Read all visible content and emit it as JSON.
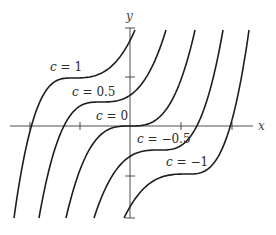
{
  "chart_data": {
    "type": "line",
    "title": "",
    "xlabel": "x",
    "ylabel": "y",
    "xlim": [
      -2.3,
      2.9
    ],
    "ylim": [
      -1.85,
      1.95
    ],
    "grid": false,
    "legend": "inline labels",
    "x_ticks": [
      -2,
      -1,
      1,
      2
    ],
    "y_ticks": [
      -2,
      -1,
      1,
      2
    ],
    "tick_labels_shown": false,
    "series": [
      {
        "name": "c = 1",
        "c": 1,
        "inflection": [
          -1.16,
          0.96
        ],
        "label_pos": [
          36,
          66
        ]
      },
      {
        "name": "c = 0.5",
        "c": 0.5,
        "inflection": [
          -0.6,
          0.48
        ],
        "label_pos": [
          62,
          92
        ]
      },
      {
        "name": "c = 0",
        "c": 0,
        "inflection": [
          0,
          0
        ],
        "label_pos": [
          96,
          117
        ]
      },
      {
        "name": "c = -0.5",
        "c": -0.5,
        "inflection": [
          0.6,
          -0.48
        ],
        "label_pos": [
          140,
          142
        ]
      },
      {
        "name": "c = -1",
        "c": -1,
        "inflection": [
          1.16,
          -0.96
        ],
        "label_pos": [
          172,
          168
        ]
      }
    ]
  },
  "axes": {
    "x_label": "x",
    "y_label": "y"
  },
  "labels": {
    "c1": {
      "var": "c",
      "eq": " = 1"
    },
    "c05": {
      "var": "c",
      "eq": " = 0.5"
    },
    "c0": {
      "var": "c",
      "eq": " = 0"
    },
    "cm05": {
      "var": "c",
      "eq": " = −0.5"
    },
    "cm1": {
      "var": "c",
      "eq": " = −1"
    }
  },
  "pixel_geometry": {
    "origin": [
      130,
      126
    ],
    "curves": [
      {
        "ix": 72,
        "iy": 78,
        "top": [
          135,
          30
        ],
        "bottom": [
          14,
          218
        ]
      },
      {
        "ix": 100,
        "iy": 102,
        "top": [
          166,
          30
        ],
        "bottom": [
          39,
          218
        ]
      },
      {
        "ix": 130,
        "iy": 126,
        "top": [
          195,
          30
        ],
        "bottom": [
          66,
          218
        ]
      },
      {
        "ix": 160,
        "iy": 150,
        "top": [
          223,
          30
        ],
        "bottom": [
          94,
          218
        ]
      },
      {
        "ix": 188,
        "iy": 174,
        "top": [
          249,
          30
        ],
        "bottom": [
          124,
          218
        ]
      }
    ]
  }
}
